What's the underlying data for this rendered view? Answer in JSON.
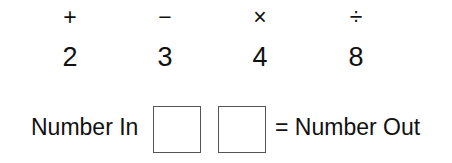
{
  "operators": [
    {
      "symbol": "+",
      "name": "plus"
    },
    {
      "symbol": "−",
      "name": "minus"
    },
    {
      "symbol": "×",
      "name": "times"
    },
    {
      "symbol": "÷",
      "name": "divide"
    }
  ],
  "numbers": [
    "2",
    "3",
    "4",
    "8"
  ],
  "equation": {
    "left_label": "Number In",
    "right_label": "= Number Out",
    "box1_value": "",
    "box2_value": ""
  }
}
